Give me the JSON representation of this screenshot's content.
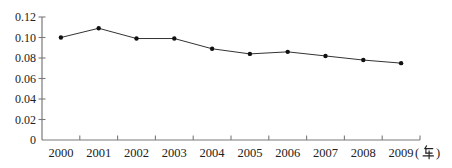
{
  "chart_data": {
    "type": "line",
    "title": "",
    "xlabel": "",
    "ylabel": "",
    "categories": [
      "2000",
      "2001",
      "2002",
      "2003",
      "2004",
      "2005",
      "2006",
      "2007",
      "2008",
      "2009"
    ],
    "values": [
      0.1,
      0.109,
      0.099,
      0.099,
      0.089,
      0.084,
      0.086,
      0.082,
      0.078,
      0.075
    ],
    "unit_label": "(年)",
    "y_tick_labels": [
      "0",
      "0.02",
      "0.04",
      "0.06",
      "0.08",
      "0.10",
      "0.12"
    ],
    "y_tick_values": [
      0,
      0.02,
      0.04,
      0.06,
      0.08,
      0.1,
      0.12
    ],
    "ylim": [
      0,
      0.12
    ],
    "grid": false,
    "legend": "none",
    "marker": "circle",
    "colors": {
      "line": "#333333",
      "marker": "#111111",
      "axis": "#7a7a7a",
      "text": "#222222"
    }
  }
}
